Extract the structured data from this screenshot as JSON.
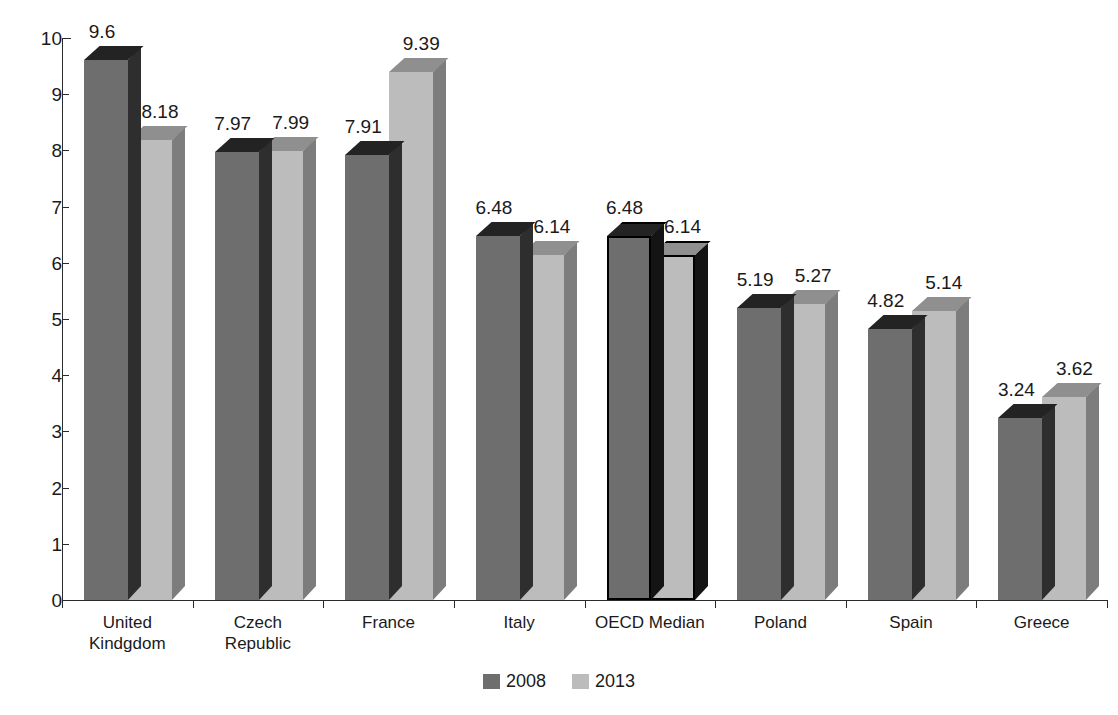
{
  "chart_data": {
    "type": "bar",
    "title": "",
    "subtitle": "",
    "xlabel": "",
    "ylabel": "",
    "ylim": [
      0,
      10
    ],
    "ytick_labels": [
      "10",
      "9",
      "8",
      "7",
      "6",
      "5",
      "4",
      "3",
      "2",
      "1",
      "0"
    ],
    "ytick_values": [
      10,
      9,
      8,
      7,
      6,
      5,
      4,
      3,
      2,
      1,
      0
    ],
    "grid": false,
    "legend_position": "bottom",
    "style": "3d-clustered-column",
    "categories": [
      "United\nKindgdom",
      "Czech\nRepublic",
      "France",
      "Italy",
      "OECD Median",
      "Poland",
      "Spain",
      "Greece"
    ],
    "highlighted_category": "OECD Median",
    "series": [
      {
        "name": "2008",
        "color": "#6e6e6e",
        "values": [
          9.6,
          7.97,
          7.91,
          6.48,
          6.48,
          5.19,
          4.82,
          3.24
        ],
        "value_labels": [
          "9.6",
          "7.97",
          "7.91",
          "6.48",
          "6.48",
          "5.19",
          "4.82",
          "3.24"
        ]
      },
      {
        "name": "2013",
        "color": "#bcbcbc",
        "values": [
          8.18,
          7.99,
          9.39,
          6.14,
          6.14,
          5.27,
          5.14,
          3.62
        ],
        "value_labels": [
          "8.18",
          "7.99",
          "9.39",
          "6.14",
          "6.14",
          "5.27",
          "5.14",
          "3.62"
        ]
      }
    ]
  },
  "legend": {
    "items": [
      {
        "label": "2008",
        "color": "#6e6e6e"
      },
      {
        "label": "2013",
        "color": "#bcbcbc"
      }
    ]
  }
}
